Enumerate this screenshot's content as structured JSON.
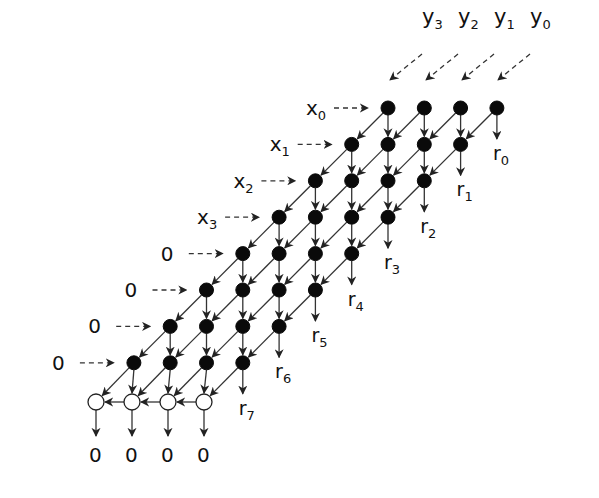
{
  "diagram": {
    "type": "systolic-array",
    "colors": {
      "filled_node": "#0a0a0a",
      "open_node": "#ffffff",
      "edge": "#333333",
      "background": "#ffffff"
    },
    "top_inputs": [
      {
        "label_main": "y",
        "label_sub": "3"
      },
      {
        "label_main": "y",
        "label_sub": "2"
      },
      {
        "label_main": "y",
        "label_sub": "1"
      },
      {
        "label_main": "y",
        "label_sub": "0"
      }
    ],
    "left_inputs": [
      {
        "label_main": "x",
        "label_sub": "0"
      },
      {
        "label_main": "x",
        "label_sub": "1"
      },
      {
        "label_main": "x",
        "label_sub": "2"
      },
      {
        "label_main": "x",
        "label_sub": "3"
      },
      {
        "label_main": "0",
        "label_sub": ""
      },
      {
        "label_main": "0",
        "label_sub": ""
      },
      {
        "label_main": "0",
        "label_sub": ""
      },
      {
        "label_main": "0",
        "label_sub": ""
      }
    ],
    "right_outputs": [
      {
        "label_main": "r",
        "label_sub": "0"
      },
      {
        "label_main": "r",
        "label_sub": "1"
      },
      {
        "label_main": "r",
        "label_sub": "2"
      },
      {
        "label_main": "r",
        "label_sub": "3"
      },
      {
        "label_main": "r",
        "label_sub": "4"
      },
      {
        "label_main": "r",
        "label_sub": "5"
      },
      {
        "label_main": "r",
        "label_sub": "6"
      },
      {
        "label_main": "r",
        "label_sub": "7"
      }
    ],
    "bottom_outputs": [
      {
        "label_main": "0"
      },
      {
        "label_main": "0"
      },
      {
        "label_main": "0"
      },
      {
        "label_main": "0"
      }
    ],
    "grid": {
      "rows": 8,
      "cols": 4,
      "open_row_count": 4
    }
  }
}
